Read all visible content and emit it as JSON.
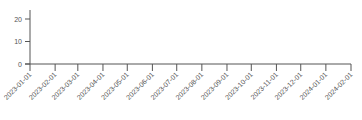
{
  "chart_data": {
    "type": "line",
    "title": "",
    "xlabel": "",
    "ylabel": "",
    "categories": [
      "2023-01-01",
      "2023-02-01",
      "2023-03-01",
      "2023-04-01",
      "2023-05-01",
      "2023-06-01",
      "2023-07-01",
      "2023-08-01",
      "2023-09-01",
      "2023-10-01",
      "2023-11-01",
      "2023-12-01",
      "2024-01-01",
      "2024-02-01"
    ],
    "series": [],
    "yticks": [
      "0",
      "10",
      "20"
    ],
    "ylim": [
      0,
      25
    ],
    "grid": false,
    "legend": null
  },
  "colors": {
    "axis": "#555555",
    "text": "#555555"
  }
}
